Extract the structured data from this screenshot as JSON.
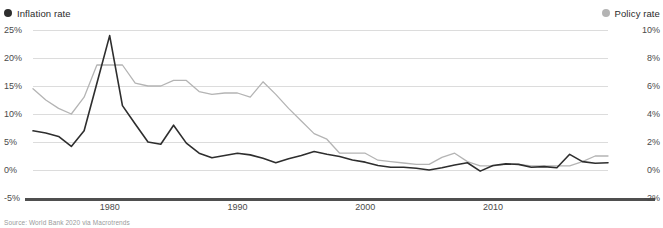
{
  "legend": {
    "inflation": {
      "label": "Inflation rate",
      "color": "#2e2e2e",
      "marker": "filled-circle"
    },
    "policy": {
      "label": "Policy rate",
      "color": "#b4b4b4",
      "marker": "filled-circle"
    }
  },
  "source": {
    "text": "Source: World Bank 2020 via Macrotrends"
  },
  "chart_data": {
    "type": "line",
    "title": "",
    "subtitle": "",
    "xlabel": "",
    "ylabel": "",
    "grid": true,
    "legend_position": "top-left-and-top-right",
    "x": [
      1974,
      1975,
      1976,
      1977,
      1978,
      1979,
      1980,
      1981,
      1982,
      1983,
      1984,
      1985,
      1986,
      1987,
      1988,
      1989,
      1990,
      1991,
      1992,
      1993,
      1994,
      1995,
      1996,
      1997,
      1998,
      1999,
      2000,
      2001,
      2002,
      2003,
      2004,
      2005,
      2006,
      2007,
      2008,
      2009,
      2010,
      2011,
      2012,
      2013,
      2014,
      2015,
      2016,
      2017,
      2018,
      2019
    ],
    "xtick_labels": [
      "1980",
      "1990",
      "2000",
      "2010"
    ],
    "xtick_values": [
      1980,
      1990,
      2000,
      2010
    ],
    "axes": [
      {
        "id": "left",
        "name": "Inflation rate",
        "side": "left",
        "ylim": [
          -5,
          25
        ],
        "ytick_values": [
          25,
          20,
          15,
          10,
          5,
          0,
          -5
        ],
        "ytick_labels": [
          "25%",
          "20%",
          "15%",
          "10%",
          "5%",
          "0%",
          "-5%"
        ]
      },
      {
        "id": "right",
        "name": "Policy rate",
        "side": "right",
        "ylim": [
          -2,
          10
        ],
        "ytick_values": [
          10,
          8,
          6,
          4,
          2,
          0,
          -2
        ],
        "ytick_labels": [
          "10%",
          "8%",
          "6%",
          "4%",
          "2%",
          "0%",
          "-2%"
        ]
      }
    ],
    "series": [
      {
        "name": "Inflation rate",
        "axis": "left",
        "color": "#2e2e2e",
        "unit": "%",
        "values": [
          7.0,
          6.6,
          6.0,
          4.2,
          7.0,
          15.5,
          24.0,
          11.5,
          8.2,
          5.0,
          4.6,
          8.0,
          4.8,
          3.0,
          2.2,
          2.6,
          3.0,
          2.7,
          2.1,
          1.3,
          2.0,
          2.6,
          3.3,
          2.8,
          2.4,
          1.8,
          1.4,
          0.8,
          0.5,
          0.5,
          0.3,
          0.0,
          0.4,
          0.9,
          1.3,
          -0.2,
          0.8,
          1.1,
          1.0,
          0.5,
          0.6,
          0.4,
          2.8,
          1.5,
          1.2,
          1.3
        ],
        "peak": {
          "x": 1980,
          "y": 24.0
        }
      },
      {
        "name": "Policy rate",
        "axis": "right",
        "color": "#b4b4b4",
        "unit": "%",
        "values": [
          5.8,
          5.0,
          4.4,
          4.0,
          5.2,
          7.5,
          7.5,
          7.5,
          6.2,
          6.0,
          6.0,
          6.4,
          6.4,
          5.6,
          5.4,
          5.5,
          5.5,
          5.2,
          6.3,
          5.4,
          4.4,
          3.5,
          2.6,
          2.2,
          1.2,
          1.2,
          1.2,
          0.7,
          0.6,
          0.5,
          0.4,
          0.4,
          0.9,
          1.2,
          0.6,
          0.3,
          0.3,
          0.4,
          0.4,
          0.3,
          0.3,
          0.3,
          0.3,
          0.6,
          1.0,
          1.0
        ],
        "peak": {
          "x": 1992,
          "y": 6.3
        }
      }
    ]
  }
}
